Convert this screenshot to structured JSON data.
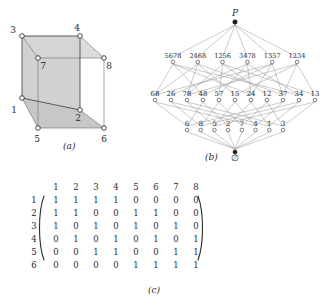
{
  "figure": {
    "captions": {
      "a": "(a)",
      "b": "(b)",
      "c": "(c)"
    }
  },
  "panel_a": {
    "name": "cube-graph",
    "vertex_labels": [
      "1",
      "2",
      "3",
      "4",
      "5",
      "6",
      "7",
      "8"
    ],
    "vertices": [
      {
        "label": "1",
        "x": 22,
        "y": 92
      },
      {
        "label": "2",
        "x": 80,
        "y": 104
      },
      {
        "label": "3",
        "x": 22,
        "y": 30
      },
      {
        "label": "4",
        "x": 80,
        "y": 30
      },
      {
        "label": "5",
        "x": 38,
        "y": 122
      },
      {
        "label": "6",
        "x": 104,
        "y": 122
      },
      {
        "label": "7",
        "x": 38,
        "y": 52
      },
      {
        "label": "8",
        "x": 104,
        "y": 52
      }
    ]
  },
  "panel_b": {
    "name": "hasse-diagram-of-subsets",
    "top_label": "P",
    "bottom_label": "∅",
    "rows": {
      "quads": [
        "5678",
        "2468",
        "1256",
        "3478",
        "1357",
        "1234"
      ],
      "pairs": [
        "68",
        "26",
        "78",
        "48",
        "57",
        "15",
        "24",
        "12",
        "37",
        "34",
        "13"
      ],
      "singletons": [
        "6",
        "8",
        "5",
        "2",
        "7",
        "4",
        "1",
        "3"
      ]
    }
  },
  "panel_c": {
    "name": "adjacency-matrix",
    "col_headers": [
      "1",
      "2",
      "3",
      "4",
      "5",
      "6",
      "7",
      "8"
    ],
    "row_headers": [
      "1",
      "2",
      "3",
      "4",
      "5",
      "6"
    ],
    "rows": [
      [
        "1",
        "1",
        "1",
        "1",
        "0",
        "0",
        "0",
        "0"
      ],
      [
        "1",
        "1",
        "0",
        "0",
        "1",
        "1",
        "0",
        "0"
      ],
      [
        "1",
        "0",
        "1",
        "0",
        "1",
        "0",
        "1",
        "0"
      ],
      [
        "0",
        "1",
        "0",
        "1",
        "0",
        "1",
        "0",
        "1"
      ],
      [
        "0",
        "0",
        "1",
        "1",
        "0",
        "0",
        "1",
        "1"
      ],
      [
        "0",
        "0",
        "0",
        "0",
        "1",
        "1",
        "1",
        "1"
      ]
    ]
  },
  "colors": {
    "cube_fill": "#c9c9c9",
    "edge": "#4a4a4a",
    "hasse_edge": "#8a8a8a",
    "text": "#2b2b2b"
  }
}
